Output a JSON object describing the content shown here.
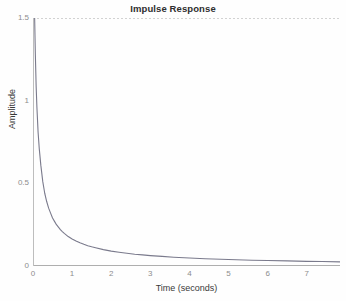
{
  "chart_data": {
    "type": "line",
    "title": "Impulse Response",
    "xlabel": "Time (seconds)",
    "ylabel": "Amplitude",
    "xlim": [
      0,
      7.85
    ],
    "ylim": [
      0,
      1.5
    ],
    "grid": false,
    "legend": null,
    "xticks": [
      0,
      1,
      2,
      3,
      4,
      5,
      6,
      7
    ],
    "xtick_labels": [
      "0",
      "1",
      "2",
      "3",
      "4",
      "5",
      "6",
      "7"
    ],
    "yticks": [
      0,
      0.5,
      1,
      1.5
    ],
    "ytick_labels": [
      "0",
      "0.5",
      "1",
      "1.5"
    ],
    "line_color": "#7a7a8c",
    "axis_color": "#b9b9b9",
    "series": [
      {
        "name": "impulse response",
        "x": [
          0.042,
          0.06,
          0.08,
          0.1,
          0.13,
          0.16,
          0.2,
          0.25,
          0.3,
          0.35,
          0.4,
          0.45,
          0.5,
          0.55,
          0.6,
          0.65,
          0.7,
          0.75,
          0.8,
          0.9,
          1.0,
          1.1,
          1.2,
          1.3,
          1.4,
          1.5,
          1.6,
          1.8,
          2.0,
          2.2,
          2.4,
          2.6,
          2.8,
          3.0,
          3.3,
          3.6,
          4.0,
          4.4,
          4.8,
          5.2,
          5.6,
          6.0,
          6.5,
          7.0,
          7.4,
          7.85
        ],
        "y": [
          1.5,
          1.28,
          1.09,
          0.96,
          0.81,
          0.71,
          0.61,
          0.51,
          0.44,
          0.39,
          0.35,
          0.32,
          0.29,
          0.27,
          0.25,
          0.235,
          0.22,
          0.208,
          0.197,
          0.178,
          0.163,
          0.151,
          0.14,
          0.131,
          0.123,
          0.116,
          0.11,
          0.099,
          0.09,
          0.083,
          0.077,
          0.071,
          0.067,
          0.063,
          0.058,
          0.053,
          0.048,
          0.044,
          0.041,
          0.038,
          0.035,
          0.033,
          0.031,
          0.028,
          0.027,
          0.025
        ]
      }
    ]
  }
}
